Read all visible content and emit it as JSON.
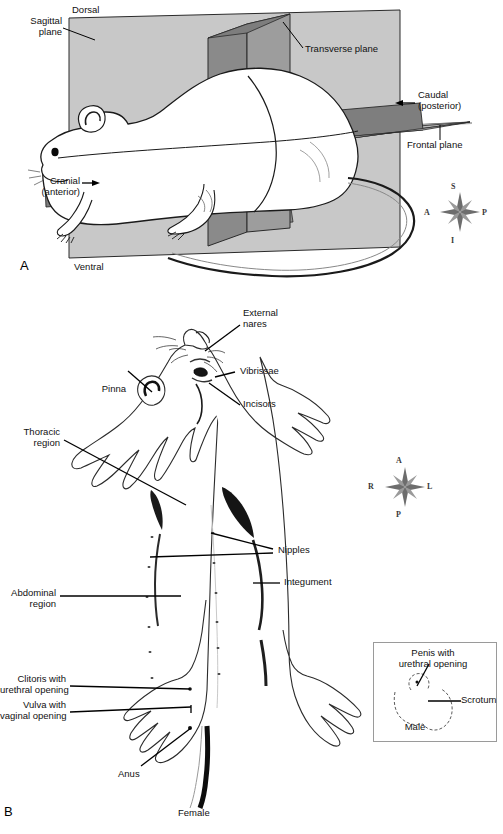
{
  "figure": {
    "panels": [
      {
        "id": "A",
        "letter": "A",
        "subject": "rat-body-planes"
      },
      {
        "id": "B",
        "letter": "B",
        "subject": "rat-ventral-external-anatomy"
      }
    ]
  },
  "panel_a": {
    "letter": "A",
    "labels": {
      "sagittal_plane": "Sagittal\nplane",
      "dorsal": "Dorsal",
      "transverse_plane": "Transverse plane",
      "caudal": "Caudal\n(posterior)",
      "frontal_plane": "Frontal plane",
      "cranial": "Cranial\n(anterior)",
      "ventral": "Ventral"
    },
    "compass": {
      "name": "orientation-compass",
      "north": "S",
      "south": "I",
      "west": "A",
      "east": "P"
    },
    "colors": {
      "sagittal_plane_fill": "#c8c8c8",
      "transverse_plane_fill": "#8a8a8a",
      "frontal_plane_fill": "#b4b4b4",
      "frontal_plane_dark_fill": "#7e7e7e",
      "outline": "#1a1a1a",
      "animal_fill": "#ffffff"
    }
  },
  "panel_b": {
    "letter": "B",
    "labels": {
      "external_nares": "External\nnares",
      "vibrissae": "Vibrissae",
      "incisors": "Incisors",
      "pinna": "Pinna",
      "thoracic_region": "Thoracic\nregion",
      "nipples": "Nipples",
      "integument": "Integument",
      "abdominal_region": "Abdominal\nregion",
      "clitoris": "Clitoris with\nurethral opening",
      "vulva": "Vulva with\nvaginal opening",
      "anus": "Anus",
      "female": "Female"
    },
    "compass": {
      "name": "orientation-compass",
      "north": "A",
      "south": "P",
      "west": "R",
      "east": "L"
    },
    "inset": {
      "name": "male-genitalia-inset",
      "penis": "Penis with\nurethral opening",
      "scrotum": "Scrotum",
      "caption": "Male",
      "border_color": "#9a9a9a"
    },
    "nipple_count": 12
  }
}
